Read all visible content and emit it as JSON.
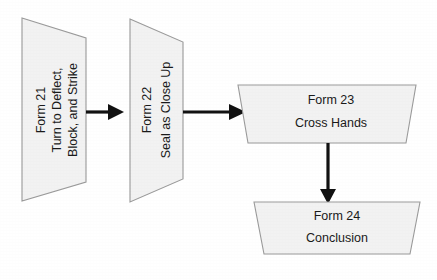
{
  "diagram": {
    "background_color": "#ffffff",
    "node_fill_color": "#f2f2f2",
    "node_border_color": "#9a9a9a",
    "connector_color": "#111111",
    "text_color": "#1a1a1a",
    "nodes": [
      {
        "id": "form-21",
        "shape": "trapezoid-rotated",
        "orientation": "vertical",
        "lines": [
          "Form 21",
          "Turn to Deflect,",
          "Block, and Strike"
        ],
        "line1": "Form 21",
        "line2": "Turn to Deflect,",
        "line3": "Block, and Strike"
      },
      {
        "id": "form-22",
        "shape": "trapezoid-rotated",
        "orientation": "vertical",
        "lines": [
          "Form 22",
          "Seal as Close Up"
        ],
        "line1": "Form 22",
        "line2": "Seal as Close Up"
      },
      {
        "id": "form-23",
        "shape": "trapezoid",
        "orientation": "horizontal",
        "lines": [
          "Form 23",
          "Cross Hands"
        ],
        "line1": "Form 23",
        "line2": "Cross Hands"
      },
      {
        "id": "form-24",
        "shape": "trapezoid",
        "orientation": "horizontal",
        "lines": [
          "Form 24",
          "Conclusion"
        ],
        "line1": "Form 24",
        "line2": "Conclusion"
      }
    ],
    "connectors": [
      {
        "id": "arrow-21-to-22",
        "from": "form-21",
        "to": "form-22",
        "direction": "right"
      },
      {
        "id": "arrow-22-to-23",
        "from": "form-22",
        "to": "form-23",
        "direction": "right"
      },
      {
        "id": "arrow-23-to-24",
        "from": "form-23",
        "to": "form-24",
        "direction": "down"
      }
    ]
  }
}
